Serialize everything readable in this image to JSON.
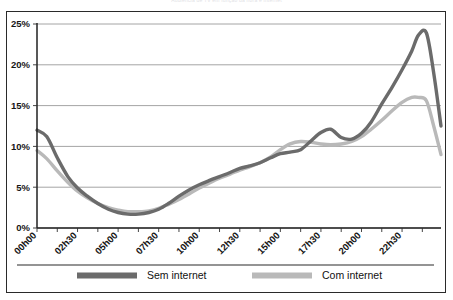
{
  "chart_data": {
    "type": "line",
    "title": "Audiência de TV em função da hora e internet",
    "xlabel": "",
    "ylabel": "",
    "ylim": [
      0,
      25
    ],
    "yticks": [
      0,
      5,
      10,
      15,
      20,
      25
    ],
    "ytick_labels": [
      "0%",
      "5%",
      "10%",
      "15%",
      "20%",
      "25%"
    ],
    "xlim": [
      0,
      24
    ],
    "xtick_labels": [
      "00h00",
      "02h30",
      "05h00",
      "07h30",
      "10h00",
      "12h30",
      "15h00",
      "17h30",
      "20h00",
      "22h30"
    ],
    "xtick_hours": [
      0,
      2.5,
      5,
      7.5,
      10,
      12.5,
      15,
      17.5,
      20,
      22.5
    ],
    "minor_tick_step_hours": 1.25,
    "grid": true,
    "legend_position": "bottom",
    "series": [
      {
        "name": "Sem internet",
        "color": "#6b6b6b",
        "x": [
          0,
          0.6,
          1.25,
          1.9,
          2.5,
          3.1,
          3.75,
          4.4,
          5,
          5.6,
          6.25,
          6.9,
          7.5,
          8.1,
          8.75,
          9.4,
          10,
          10.6,
          11.25,
          11.9,
          12.5,
          13.1,
          13.75,
          14.4,
          15,
          15.6,
          16.25,
          16.9,
          17.5,
          18.1,
          18.75,
          19.4,
          20,
          20.6,
          21.25,
          21.9,
          22.5,
          23.1,
          23.5,
          24
        ],
        "y": [
          12.0,
          11.2,
          8.6,
          6.3,
          4.9,
          3.9,
          3.0,
          2.3,
          1.9,
          1.7,
          1.7,
          1.9,
          2.3,
          3.0,
          3.9,
          4.7,
          5.3,
          5.8,
          6.3,
          6.8,
          7.3,
          7.6,
          8.0,
          8.6,
          9.1,
          9.3,
          9.6,
          10.7,
          11.7,
          12.1,
          11.1,
          10.9,
          11.6,
          13.0,
          15.2,
          17.3,
          19.4,
          21.7,
          23.6,
          23.9
        ]
      },
      {
        "name": "Com internet",
        "color": "#b9b9b9",
        "x": [
          0,
          0.6,
          1.25,
          1.9,
          2.5,
          3.1,
          3.75,
          4.4,
          5,
          5.6,
          6.25,
          6.9,
          7.5,
          8.1,
          8.75,
          9.4,
          10,
          10.6,
          11.25,
          11.9,
          12.5,
          13.1,
          13.75,
          14.4,
          15,
          15.6,
          16.25,
          16.9,
          17.5,
          18.1,
          18.75,
          19.4,
          20,
          20.6,
          21.25,
          21.9,
          22.5,
          23.1,
          23.5,
          24
        ],
        "y": [
          9.5,
          8.5,
          7.0,
          5.6,
          4.5,
          3.7,
          3.0,
          2.5,
          2.2,
          2.0,
          2.0,
          2.1,
          2.4,
          2.9,
          3.5,
          4.2,
          4.9,
          5.5,
          6.1,
          6.6,
          7.1,
          7.5,
          8.0,
          8.7,
          9.6,
          10.3,
          10.6,
          10.5,
          10.3,
          10.2,
          10.3,
          10.6,
          11.2,
          12.1,
          13.2,
          14.4,
          15.4,
          16.0,
          16.0,
          15.6
        ]
      }
    ],
    "series_tail": [
      {
        "name": "Sem internet",
        "x": [
          24,
          24.45,
          24.9
        ],
        "y": [
          23.9,
          19.0,
          12.5
        ]
      },
      {
        "name": "Com internet",
        "x": [
          24,
          24.45,
          24.9
        ],
        "y": [
          15.6,
          12.5,
          9.0
        ]
      }
    ]
  },
  "legend": {
    "items": [
      {
        "label": "Sem internet",
        "color": "#6b6b6b"
      },
      {
        "label": "Com internet",
        "color": "#b9b9b9"
      }
    ]
  }
}
